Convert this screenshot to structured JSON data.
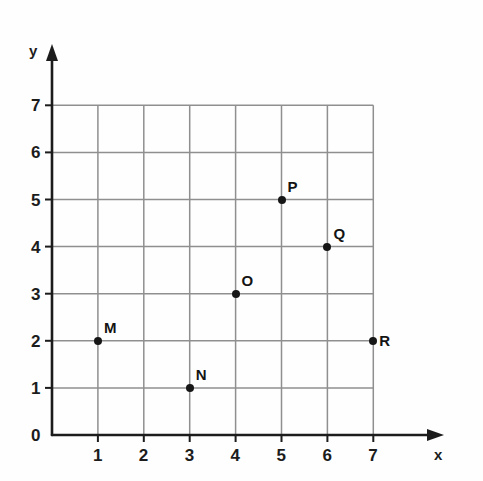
{
  "figure": {
    "background_color": "#fefefe",
    "ink_color": "#1c1c1c",
    "grid_color": "#8f8f8f"
  },
  "axes": {
    "x_axis_name": "x",
    "y_axis_name": "y",
    "origin_label": "0",
    "x_tick_labels": [
      "1",
      "2",
      "3",
      "4",
      "5",
      "6",
      "7"
    ],
    "y_tick_labels": [
      "1",
      "2",
      "3",
      "4",
      "5",
      "6",
      "7"
    ]
  },
  "chart_data": {
    "type": "scatter",
    "title": "",
    "xlabel": "x",
    "ylabel": "y",
    "xlim": [
      0,
      7
    ],
    "ylim": [
      0,
      7
    ],
    "xticks": [
      0,
      1,
      2,
      3,
      4,
      5,
      6,
      7
    ],
    "yticks": [
      0,
      1,
      2,
      3,
      4,
      5,
      6,
      7
    ],
    "grid": true,
    "legend": "none",
    "points": [
      {
        "label": "M",
        "x": 1,
        "y": 2,
        "label_pos": "upper-right"
      },
      {
        "label": "N",
        "x": 3,
        "y": 1,
        "label_pos": "upper-right"
      },
      {
        "label": "O",
        "x": 4,
        "y": 3,
        "label_pos": "upper-right"
      },
      {
        "label": "P",
        "x": 5,
        "y": 5,
        "label_pos": "upper-right"
      },
      {
        "label": "Q",
        "x": 6,
        "y": 4,
        "label_pos": "upper-right"
      },
      {
        "label": "R",
        "x": 7,
        "y": 2,
        "label_pos": "right"
      }
    ]
  }
}
